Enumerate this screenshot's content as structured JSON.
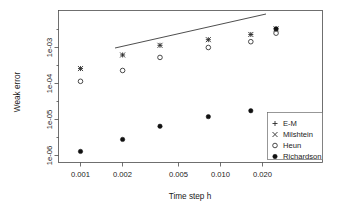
{
  "chart_data": {
    "type": "scatter",
    "title": "",
    "xlabel": "Time step h",
    "ylabel": "Weak error",
    "xscale": "log",
    "yscale": "log",
    "xlim": [
      0.0008,
      0.03
    ],
    "ylim": [
      7e-07,
      0.004
    ],
    "grid": false,
    "legend_position": "bottom-right",
    "x_ticks": [
      {
        "value": 0.001,
        "label": "0.001"
      },
      {
        "value": 0.002,
        "label": "0.002"
      },
      {
        "value": 0.005,
        "label": "0.005"
      },
      {
        "value": 0.01,
        "label": "0.010"
      },
      {
        "value": 0.02,
        "label": "0.020"
      }
    ],
    "y_ticks": [
      {
        "value": 1e-06,
        "label": "1e-06"
      },
      {
        "value": 1e-05,
        "label": "1e-05"
      },
      {
        "value": 0.0001,
        "label": "1e-04"
      },
      {
        "value": 0.001,
        "label": "1e-03"
      }
    ],
    "x": [
      0.001,
      0.002,
      0.0037,
      0.0082,
      0.0165,
      0.025
    ],
    "series": [
      {
        "name": "E-M",
        "marker": "plus",
        "values": [
          0.00026,
          0.00062,
          0.00115,
          0.00165,
          0.0023,
          0.0033
        ]
      },
      {
        "name": "Milshtein",
        "marker": "cross",
        "values": [
          0.00026,
          0.00062,
          0.00115,
          0.00165,
          0.0023,
          0.0033
        ]
      },
      {
        "name": "Heun",
        "marker": "open-circle",
        "values": [
          0.000115,
          0.00023,
          0.00053,
          0.001,
          0.00145,
          0.0025
        ]
      },
      {
        "name": "Richardson",
        "marker": "filled-circle",
        "values": [
          1.3e-06,
          2.8e-06,
          6.5e-06,
          1.2e-05,
          1.75e-05,
          0.0033
        ]
      }
    ],
    "reference_line": {
      "label": "",
      "x_start": 0.00215,
      "y_start": 0.00069,
      "x_end": 0.0175,
      "y_end": 0.0036
    },
    "annotations": []
  },
  "legend": {
    "items": [
      {
        "label": "E-M",
        "marker": "plus"
      },
      {
        "label": "Milshtein",
        "marker": "cross"
      },
      {
        "label": "Heun",
        "marker": "open-circle"
      },
      {
        "label": "Richardson",
        "marker": "filled-circle"
      }
    ]
  }
}
